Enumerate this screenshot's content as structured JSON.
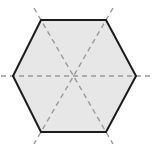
{
  "figure": {
    "name": "regular-hexagon-with-diagonals",
    "type": "geometry-diagram",
    "canvas": {
      "width": 159,
      "height": 152,
      "background_color": "#ffffff"
    },
    "shape": {
      "label": "regular hexagon",
      "sides": 6,
      "orientation": "flat-top-pointy-sides",
      "fill_color": "#e7e7e7",
      "stroke_color": "#1c1c1c",
      "stroke_width": 2.0,
      "center": {
        "x": 74,
        "y": 76
      },
      "circumradius": 61,
      "vertices": [
        {
          "id": "top-left",
          "x": 41,
          "y": 20
        },
        {
          "id": "top-right",
          "x": 106,
          "y": 20
        },
        {
          "id": "right",
          "x": 136,
          "y": 76
        },
        {
          "id": "bottom-right",
          "x": 106,
          "y": 132
        },
        {
          "id": "bottom-left",
          "x": 41,
          "y": 132
        },
        {
          "id": "left",
          "x": 13,
          "y": 76
        }
      ]
    },
    "diagonals": {
      "label": "long diagonals through center",
      "count": 3,
      "stroke_color": "#9a9a9a",
      "stroke_width": 1.4,
      "dash_pattern": "5 4",
      "overshoot": 12,
      "lines": [
        {
          "id": "diagonal-horizontal",
          "from": "left",
          "to": "right",
          "x1": 1,
          "y1": 76,
          "x2": 150,
          "y2": 76
        },
        {
          "id": "diagonal-descending",
          "from": "top-left",
          "to": "bottom-right",
          "x1": 34,
          "y1": 8,
          "x2": 113,
          "y2": 144
        },
        {
          "id": "diagonal-ascending",
          "from": "top-right",
          "to": "bottom-left",
          "x1": 113,
          "y1": 8,
          "x2": 34,
          "y2": 144
        }
      ]
    },
    "regions": {
      "label": "six congruent equilateral triangles",
      "count": 6
    }
  }
}
